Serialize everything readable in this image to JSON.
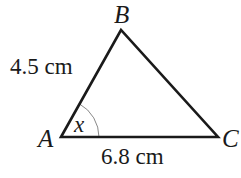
{
  "diagram": {
    "type": "triangle",
    "vertices": {
      "A": {
        "label": "A",
        "x": 61,
        "y": 137
      },
      "B": {
        "label": "B",
        "x": 121,
        "y": 30
      },
      "C": {
        "label": "C",
        "x": 218,
        "y": 137
      }
    },
    "sides": {
      "AB": {
        "label": "4.5 cm"
      },
      "AC": {
        "label": "6.8 cm"
      }
    },
    "angle": {
      "vertex": "A",
      "label": "x"
    },
    "colors": {
      "stroke": "#1a1a1a",
      "arc": "#888888",
      "background": "#ffffff"
    }
  }
}
